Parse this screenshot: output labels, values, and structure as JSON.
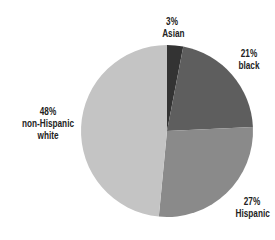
{
  "chart_data": {
    "type": "pie",
    "title": "",
    "categories": [
      "Asian",
      "black",
      "Hispanic",
      "non-Hispanic white"
    ],
    "values": [
      3,
      21,
      27,
      48
    ],
    "labels": [
      "3%",
      "21%",
      "27%",
      "48%"
    ],
    "colors": [
      "#333333",
      "#5e5e5e",
      "#8a8a8a",
      "#c4c4c4"
    ],
    "start_angle": "12 o'clock, clockwise",
    "legend": "none; direct labels"
  },
  "labels": {
    "asian": {
      "pct": "3%",
      "name": "Asian"
    },
    "black": {
      "pct": "21%",
      "name": "black"
    },
    "hispanic": {
      "pct": "27%",
      "name": "Hispanic"
    },
    "white": {
      "pct": "48%",
      "name": "non-Hispanic white"
    }
  }
}
